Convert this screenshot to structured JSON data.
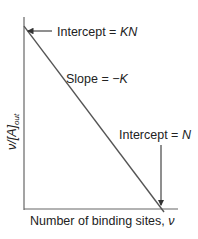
{
  "figure": {
    "type": "scatchard-plot",
    "y_axis_label": {
      "main": "ν/[A]",
      "subscript": "out"
    },
    "x_axis_label": {
      "main": "Number of binding sites, ",
      "variable": "ν"
    },
    "annotations": {
      "y_intercept": {
        "prefix": "Intercept = ",
        "value": "KN"
      },
      "slope": {
        "prefix": "Slope = ",
        "value": "−K"
      },
      "x_intercept": {
        "prefix": "Intercept = ",
        "value": "N"
      }
    },
    "colors": {
      "line": "#555555",
      "axis": "#666666",
      "text": "#222222"
    }
  },
  "chart_data": {
    "type": "line",
    "title": "",
    "xlabel": "Number of binding sites, ν",
    "ylabel": "ν/[A]out",
    "series": [
      {
        "name": "Scatchard line",
        "x": [
          0,
          1
        ],
        "y": [
          1,
          0
        ]
      }
    ],
    "xlim": [
      0,
      1.1
    ],
    "ylim": [
      0,
      1.05
    ],
    "grid": false,
    "annotations": [
      "Intercept = KN",
      "Slope = −K",
      "Intercept = N"
    ]
  }
}
